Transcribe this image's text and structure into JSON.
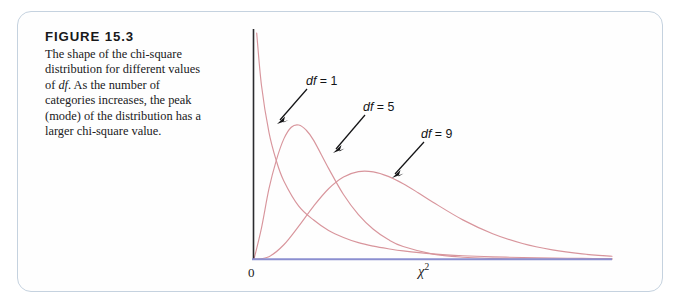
{
  "figure": {
    "label": "FIGURE 15.3",
    "caption_lines": [
      "The shape of the chi-square",
      "distribution for different",
      "values of df. As the number",
      "of categories increases,",
      "the peak (mode) of the",
      "distribution has a larger",
      "chi-square value."
    ],
    "caption_full": "The shape of the chi-square distribution for different values of df. As the number of categories increases, the peak (mode) of the distribution has a larger chi-square value.",
    "border_color": "#c5d2df"
  },
  "axes": {
    "origin_label": "0",
    "x_axis_label": "χ",
    "x_axis_label_exponent": "2",
    "x_axis_color": "#8b8fd0",
    "y_axis_color": "#2a2a2e"
  },
  "annotations": [
    {
      "name": "df1",
      "prefix": "df",
      "text": " = 1",
      "full": "df = 1"
    },
    {
      "name": "df5",
      "prefix": "df",
      "text": " = 5",
      "full": "df = 5"
    },
    {
      "name": "df9",
      "prefix": "df",
      "text": " = 9",
      "full": "df = 9"
    }
  ],
  "chart_data": {
    "type": "line",
    "xlabel": "chi-square",
    "ylabel": "",
    "grid": false,
    "legend_position": "inline-annotations",
    "curve_color": "#d8959c",
    "xlim": [
      0,
      24
    ],
    "ylim": [
      0,
      0.26
    ],
    "series": [
      {
        "name": "df = 1",
        "df": 1,
        "color": "#d8959c",
        "mode": 0,
        "annotation": "df = 1",
        "x": [
          0.18,
          0.5,
          1,
          1.5,
          2,
          3,
          4,
          5,
          6,
          7,
          8,
          9,
          10,
          12,
          14,
          16,
          18,
          20,
          22,
          24
        ],
        "y": [
          0.26,
          0.2,
          0.146,
          0.113,
          0.09,
          0.061,
          0.045,
          0.033,
          0.025,
          0.019,
          0.015,
          0.012,
          0.0095,
          0.0061,
          0.004,
          0.0027,
          0.0019,
          0.0013,
          0.0009,
          0.00065
        ]
      },
      {
        "name": "df = 5",
        "df": 5,
        "color": "#d8959c",
        "mode": 3,
        "annotation": "df = 5",
        "x": [
          0,
          0.5,
          1,
          1.5,
          2,
          2.5,
          3,
          3.5,
          4,
          5,
          6,
          7,
          8,
          9,
          10,
          12,
          14,
          16,
          18,
          20,
          22,
          24
        ],
        "y": [
          0,
          0.0358,
          0.0807,
          0.1139,
          0.1383,
          0.1517,
          0.1542,
          0.1483,
          0.1366,
          0.1044,
          0.0743,
          0.0512,
          0.0344,
          0.0226,
          0.0146,
          0.0059,
          0.0023,
          0.0009,
          0.0003,
          0.0001,
          4e-05,
          2e-05
        ]
      },
      {
        "name": "df = 9",
        "df": 9,
        "color": "#d8959c",
        "mode": 7,
        "annotation": "df = 9",
        "x": [
          0,
          1,
          2,
          3,
          4,
          5,
          6,
          7,
          8,
          9,
          10,
          11,
          12,
          14,
          16,
          18,
          20,
          22,
          24
        ],
        "y": [
          0,
          0.0029,
          0.0166,
          0.038,
          0.0611,
          0.081,
          0.0945,
          0.1007,
          0.1004,
          0.0952,
          0.0867,
          0.0764,
          0.0655,
          0.0452,
          0.0293,
          0.018,
          0.0107,
          0.0061,
          0.0034
        ]
      }
    ]
  }
}
